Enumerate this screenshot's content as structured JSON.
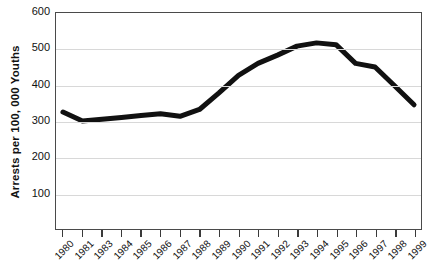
{
  "chart_data": {
    "type": "line",
    "title": "",
    "subtitle": "",
    "xlabel": "",
    "ylabel": "Arrests per 100, 000 Youths",
    "ylim": [
      0,
      600
    ],
    "ytick_values": [
      600,
      500,
      400,
      300,
      200,
      100
    ],
    "ytick_labels": [
      "600",
      "500",
      "400",
      "300",
      "200",
      "100"
    ],
    "grid": "horizontal",
    "legend": "none",
    "line_color": "#111111",
    "line_width_px": 5,
    "categories": [
      "1980",
      "1981",
      "1983",
      "1984",
      "1985",
      "1986",
      "1987",
      "1988",
      "1989",
      "1990",
      "1991",
      "1992",
      "1993",
      "1994",
      "1995",
      "1996",
      "1997",
      "1998",
      "1999"
    ],
    "series": [
      {
        "name": "Juvenile violent crime arrest rate",
        "values": [
          325,
          300,
          305,
          310,
          315,
          320,
          313,
          332,
          378,
          427,
          460,
          483,
          508,
          517,
          512,
          460,
          450,
          398,
          345
        ]
      }
    ],
    "annotations": []
  },
  "axes": {
    "y_title": "Arrests per 100, 000 Youths"
  }
}
